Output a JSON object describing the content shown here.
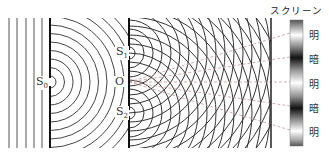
{
  "labels": {
    "source": "S",
    "source_sub": "0",
    "slit1": "S",
    "slit1_sub": "1",
    "slit2": "S",
    "slit2_sub": "2",
    "midpoint": "O",
    "screen_title": "スクリーン"
  },
  "fringes": [
    {
      "label": "明",
      "meaning": "bright"
    },
    {
      "label": "暗",
      "meaning": "dark"
    },
    {
      "label": "明",
      "meaning": "bright"
    },
    {
      "label": "暗",
      "meaning": "dark"
    },
    {
      "label": "明",
      "meaning": "bright"
    }
  ],
  "colors": {
    "line": "#333333",
    "dash": "#c09a9a",
    "barrier": "#111111"
  }
}
